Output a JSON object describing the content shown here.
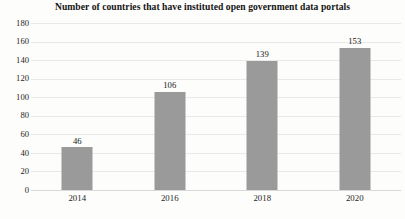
{
  "chart_data": {
    "type": "bar",
    "title": "Number of countries that have instituted open government data portals",
    "xlabel": "",
    "ylabel": "",
    "categories": [
      "2014",
      "2016",
      "2018",
      "2020"
    ],
    "values": [
      46,
      106,
      139,
      153
    ],
    "value_labels": [
      "46",
      "106",
      "139",
      "153"
    ],
    "ylim": [
      0,
      180
    ],
    "ytick_step": 20,
    "yticks": [
      "180",
      "160",
      "140",
      "120",
      "100",
      "80",
      "60",
      "40",
      "20",
      "0"
    ],
    "grid": true,
    "grid_axis": "y",
    "legend": false,
    "legend_position": "none",
    "bar_color": "#9a9a9a",
    "gridline_color": "#e9e9e9",
    "text_color": "#141414",
    "background_color": "#fdfdfc"
  }
}
